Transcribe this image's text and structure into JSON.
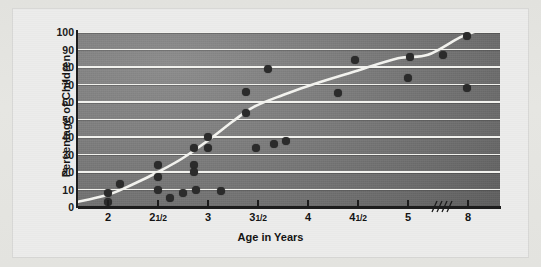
{
  "chart_data": {
    "type": "scatter",
    "title": "",
    "xlabel": "Age in Years",
    "ylabel": "Percentage of Children",
    "grid": true,
    "legend": null,
    "ylim": [
      0,
      100
    ],
    "ytick_labels": [
      "100",
      "90",
      "80",
      "70",
      "60",
      "50",
      "40",
      "30",
      "20",
      "10",
      "0"
    ],
    "ytick_values": [
      100,
      90,
      80,
      70,
      60,
      50,
      40,
      30,
      20,
      10,
      0
    ],
    "xtick_labels": [
      "2",
      "2½",
      "3",
      "3½",
      "4",
      "4½",
      "5",
      "8"
    ],
    "xtick_label_parts": [
      {
        "whole": "2",
        "frac": ""
      },
      {
        "whole": "2",
        "frac": "1/2"
      },
      {
        "whole": "3",
        "frac": ""
      },
      {
        "whole": "3",
        "frac": "1/2"
      },
      {
        "whole": "4",
        "frac": ""
      },
      {
        "whole": "4",
        "frac": "1/2"
      },
      {
        "whole": "5",
        "frac": ""
      },
      {
        "whole": "8",
        "frac": ""
      }
    ],
    "xtick_values": [
      2,
      2.5,
      3,
      3.5,
      4,
      4.5,
      5,
      8
    ],
    "axis_break": {
      "present": true,
      "symbol": "////",
      "between": [
        5,
        8
      ]
    },
    "points": [
      {
        "x": 1.65,
        "y": 5
      },
      {
        "x": 2.0,
        "y": 8
      },
      {
        "x": 2.0,
        "y": 3
      },
      {
        "x": 2.12,
        "y": 13
      },
      {
        "x": 2.5,
        "y": 24
      },
      {
        "x": 2.5,
        "y": 17
      },
      {
        "x": 2.5,
        "y": 10
      },
      {
        "x": 2.62,
        "y": 5
      },
      {
        "x": 2.75,
        "y": 8
      },
      {
        "x": 2.86,
        "y": 34
      },
      {
        "x": 2.86,
        "y": 24
      },
      {
        "x": 2.86,
        "y": 20
      },
      {
        "x": 2.88,
        "y": 10
      },
      {
        "x": 3.0,
        "y": 40
      },
      {
        "x": 3.0,
        "y": 34
      },
      {
        "x": 3.13,
        "y": 9
      },
      {
        "x": 3.38,
        "y": 66
      },
      {
        "x": 3.38,
        "y": 54
      },
      {
        "x": 3.48,
        "y": 34
      },
      {
        "x": 3.6,
        "y": 79
      },
      {
        "x": 3.66,
        "y": 36
      },
      {
        "x": 3.78,
        "y": 38
      },
      {
        "x": 4.3,
        "y": 65
      },
      {
        "x": 4.47,
        "y": 84
      },
      {
        "x": 5.0,
        "y": 74
      },
      {
        "x": 5.02,
        "y": 86
      },
      {
        "x": 5.35,
        "y": 87
      },
      {
        "x": 7.95,
        "y": 98
      },
      {
        "x": 7.95,
        "y": 68
      }
    ],
    "trend_line": {
      "style": "smooth-curve",
      "color": "#f2f2ee",
      "points": [
        {
          "x": 1.62,
          "y": 2
        },
        {
          "x": 2.0,
          "y": 7
        },
        {
          "x": 2.25,
          "y": 13
        },
        {
          "x": 2.5,
          "y": 20
        },
        {
          "x": 2.75,
          "y": 28
        },
        {
          "x": 3.0,
          "y": 38
        },
        {
          "x": 3.25,
          "y": 49
        },
        {
          "x": 3.45,
          "y": 57
        },
        {
          "x": 3.75,
          "y": 64
        },
        {
          "x": 4.1,
          "y": 71
        },
        {
          "x": 4.5,
          "y": 78
        },
        {
          "x": 4.9,
          "y": 85
        },
        {
          "x": 5.2,
          "y": 87
        },
        {
          "x": 7.6,
          "y": 97
        },
        {
          "x": 8.3,
          "y": 100
        }
      ]
    },
    "series": [
      {
        "name": "Observed studies",
        "marker": "filled-circle",
        "color": "#2b2b2b"
      },
      {
        "name": "Fitted trend",
        "marker": "line",
        "color": "#f2f2ee"
      }
    ],
    "plot_background": {
      "type": "gradient",
      "colors": [
        "#8d8d8d",
        "#7e7e7e",
        "#6e6e6e",
        "#5e5e5e",
        "#555555"
      ]
    },
    "panel_background": "#ececeb",
    "gridline_color": "#f2f2ee",
    "axis_color": "#1d1d1d"
  }
}
